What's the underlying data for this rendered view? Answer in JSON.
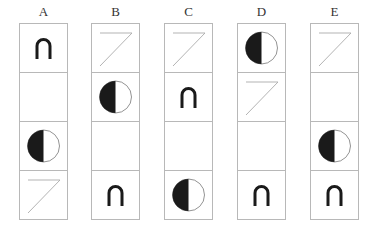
{
  "puzzle": {
    "columns": [
      {
        "label": "A",
        "cells": [
          "arch",
          "empty",
          "half-circle",
          "z-line"
        ]
      },
      {
        "label": "B",
        "cells": [
          "z-line",
          "half-circle",
          "empty",
          "arch"
        ]
      },
      {
        "label": "C",
        "cells": [
          "z-line",
          "arch",
          "empty",
          "half-circle"
        ]
      },
      {
        "label": "D",
        "cells": [
          "half-circle",
          "z-line",
          "empty",
          "arch"
        ]
      },
      {
        "label": "E",
        "cells": [
          "z-line",
          "empty",
          "half-circle",
          "arch"
        ]
      }
    ],
    "column_x": [
      19,
      91,
      164,
      237,
      310
    ],
    "colors": {
      "border": "#b8b8b8",
      "shape": "#1a1a1a",
      "line": "#aaaaaa"
    }
  }
}
